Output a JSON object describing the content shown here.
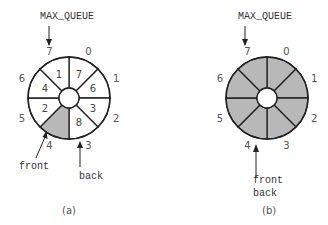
{
  "colors": {
    "stroke": "#222222",
    "empty_fill": "#ffffff",
    "occupied_fill": "#b8b8b8"
  },
  "diagrams": [
    {
      "id": "a",
      "caption": "(a)",
      "max_label": "MAX_QUEUE",
      "indices": [
        "0",
        "1",
        "2",
        "3",
        "4",
        "5",
        "6",
        "7"
      ],
      "slots": [
        "7",
        "6",
        "3",
        "8",
        "",
        "2",
        "4",
        "1"
      ],
      "shaded_slots": [
        4
      ],
      "front_label": "front",
      "back_label": "back",
      "front_index": 4,
      "back_index": 3
    },
    {
      "id": "b",
      "caption": "(b)",
      "max_label": "MAX_QUEUE",
      "indices": [
        "0",
        "1",
        "2",
        "3",
        "4",
        "5",
        "6",
        "7"
      ],
      "slots": [
        "",
        "",
        "",
        "",
        "",
        "",
        "",
        ""
      ],
      "shaded_slots": [
        0,
        1,
        2,
        3,
        4,
        5,
        6,
        7
      ],
      "front_label": "front",
      "back_label": "back",
      "front_index": 4,
      "back_index": 4
    }
  ]
}
